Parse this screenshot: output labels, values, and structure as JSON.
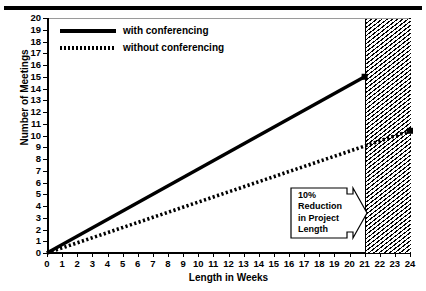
{
  "chart_data": {
    "type": "line",
    "title": "",
    "xlabel": "Length in Weeks",
    "ylabel": "Number of Meetings",
    "xlim": [
      0,
      24
    ],
    "ylim": [
      0,
      20
    ],
    "xticks": [
      "0",
      "1",
      "2",
      "3",
      "4",
      "5",
      "6",
      "7",
      "8",
      "9",
      "10",
      "11",
      "12",
      "13",
      "14",
      "15",
      "16",
      "17",
      "18",
      "19",
      "20",
      "21",
      "22",
      "23",
      "24"
    ],
    "yticks": [
      "0",
      "1",
      "2",
      "3",
      "4",
      "5",
      "6",
      "7",
      "8",
      "9",
      "10",
      "11",
      "12",
      "13",
      "14",
      "15",
      "16",
      "17",
      "18",
      "19",
      "20"
    ],
    "grid": false,
    "legend_position": "top-left",
    "series": [
      {
        "name": "with conferencing",
        "style": "solid",
        "endpoint_marker": true,
        "points": [
          [
            0,
            0
          ],
          [
            21,
            15
          ]
        ]
      },
      {
        "name": "without conferencing",
        "style": "dotted",
        "endpoint_marker": true,
        "points": [
          [
            0,
            0
          ],
          [
            24,
            10.4
          ]
        ]
      }
    ],
    "shaded_region": {
      "label": "10% Reduction in Project Length",
      "x_start": 21,
      "x_end": 24,
      "fill": "diagonal-hatch"
    },
    "annotation": {
      "lines": [
        "10%",
        "Reduction",
        "in Project",
        "Length"
      ],
      "shape": "right-arrow-banner",
      "points_to": "shaded-region"
    }
  },
  "legend": {
    "items": [
      {
        "label": "with conferencing",
        "style": "solid"
      },
      {
        "label": "without conferencing",
        "style": "dotted"
      }
    ]
  },
  "colors": {
    "ink": "#000000",
    "paper": "#ffffff",
    "frame_top": "#9a9a9a"
  }
}
